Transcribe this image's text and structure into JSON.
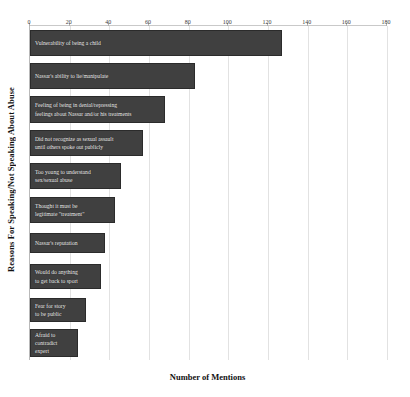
{
  "chart_data": {
    "type": "bar",
    "orientation": "horizontal",
    "title": "",
    "xlabel": "Number of Mentions",
    "ylabel": "Reasons For Speaking/Not Speaking About Abuse",
    "xlim": [
      0,
      180
    ],
    "xticks": [
      0,
      20,
      40,
      60,
      80,
      100,
      120,
      140,
      160,
      180
    ],
    "grid": true,
    "legend": "none",
    "bar_color": "#404040",
    "label_color": "#f0f0f0",
    "categories": [
      "Vulnerability of being a child",
      "Nassar's ability to lie/manipulate",
      "Feeling of being in denial/repressing\nfeelings about Nassar and/or his treatments",
      "Did not recognize as sexual assault\nuntil others spoke out publicly",
      "Too young to understand\nsex/sexual abuse",
      "Thought it must be\nlegitimate \"treatment\"",
      "Nassar's reputation",
      "Would do anything\nto get back to sport",
      "Fear for story\nto be public",
      "Afraid to\ncontradict\nexpert"
    ],
    "values": [
      127,
      83,
      68,
      57,
      46,
      43,
      38,
      36,
      28,
      24
    ]
  },
  "axis": {
    "x_title": "Number of Mentions",
    "y_title": "Reasons For Speaking/Not Speaking About Abuse",
    "tick_labels": [
      "0",
      "20",
      "40",
      "60",
      "80",
      "100",
      "120",
      "140",
      "160",
      "180"
    ]
  }
}
